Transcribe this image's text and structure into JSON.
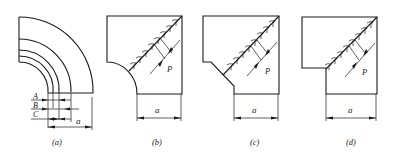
{
  "figure": {
    "panels": [
      {
        "id": "a",
        "caption": "(a)",
        "dimension_label": "a",
        "layer_labels": [
          "A",
          "B",
          "C"
        ],
        "shape": "quarter-ring elbow with three concentric inner arcs"
      },
      {
        "id": "b",
        "caption": "(b)",
        "dimension_label": "a",
        "pitch_label": "P",
        "shape": "square with concave circular notch"
      },
      {
        "id": "c",
        "caption": "(c)",
        "dimension_label": "a",
        "pitch_label": "P",
        "shape": "square with chamfered notch"
      },
      {
        "id": "d",
        "caption": "(d)",
        "dimension_label": "a",
        "pitch_label": "P",
        "shape": "square with rectangular notch"
      }
    ],
    "colors": {
      "line": "#1a1a1a",
      "background": "#ffffff"
    }
  }
}
